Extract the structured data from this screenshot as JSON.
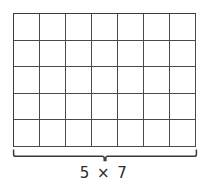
{
  "diagram": {
    "type": "array-model",
    "label": "5 × 7",
    "rows": 5,
    "columns": 7,
    "total_cells": 35,
    "grid_line_color": "#4a4a4a",
    "cell_fill_color": "#ffffff",
    "label_color": "#2b2b2b",
    "brace": {
      "name": "width-brace",
      "orientation": "horizontal",
      "spans": "columns",
      "color": "#3a3a3a"
    }
  },
  "chart_data": {
    "type": "table",
    "title": "5 × 7",
    "rows": 5,
    "columns": 7,
    "values": [
      [
        "",
        "",
        "",
        "",
        "",
        "",
        ""
      ],
      [
        "",
        "",
        "",
        "",
        "",
        "",
        ""
      ],
      [
        "",
        "",
        "",
        "",
        "",
        "",
        ""
      ],
      [
        "",
        "",
        "",
        "",
        "",
        "",
        ""
      ],
      [
        "",
        "",
        "",
        "",
        "",
        "",
        ""
      ]
    ],
    "annotations": [
      "5 × 7"
    ]
  }
}
